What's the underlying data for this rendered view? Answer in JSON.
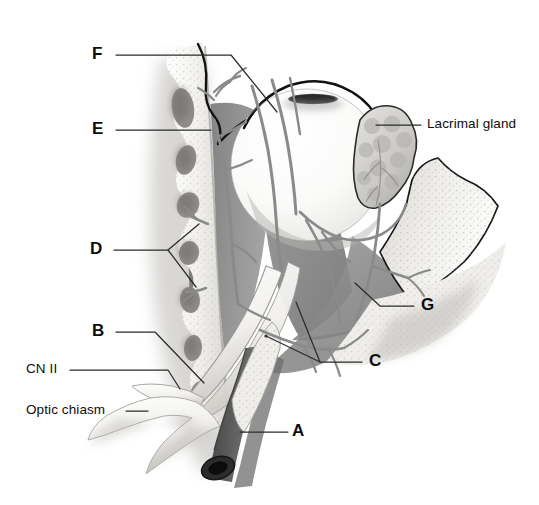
{
  "figure": {
    "style": "grayscale medical illustration",
    "background_color": "#ffffff",
    "line_color": "#1a1a1a"
  },
  "palette": {
    "bone_light": "#f2f1ee",
    "bone_mid": "#dddbd6",
    "bone_shadow": "#a9a7a2",
    "soft_tissue_dark": "#8d8d8d",
    "soft_tissue_mid": "#a6a6a6",
    "globe_white": "#fbfbfa",
    "globe_shadow": "#cfcfcd",
    "vessel_gray": "#8a8a8a",
    "vessel_dark": "#6f6f6f",
    "pupil_dark": "#111111",
    "artery_dark": "#4a4a4a",
    "gland_gray": "#c3c3c1",
    "leader_line": "#2b2b2b"
  },
  "labels": [
    {
      "id": "A",
      "text": "A",
      "kind": "letter",
      "x": 292,
      "y": 424,
      "anchor": "left"
    },
    {
      "id": "B",
      "text": "B",
      "kind": "letter",
      "x": 92,
      "y": 326,
      "anchor": "left"
    },
    {
      "id": "C",
      "text": "C",
      "kind": "letter",
      "x": 369,
      "y": 355,
      "anchor": "left"
    },
    {
      "id": "D",
      "text": "D",
      "kind": "letter",
      "x": 90,
      "y": 243,
      "anchor": "left"
    },
    {
      "id": "E",
      "text": "E",
      "kind": "letter",
      "x": 92,
      "y": 124,
      "anchor": "left"
    },
    {
      "id": "F",
      "text": "F",
      "kind": "letter",
      "x": 92,
      "y": 49,
      "anchor": "left"
    },
    {
      "id": "G",
      "text": "G",
      "kind": "letter",
      "x": 421,
      "y": 299,
      "anchor": "left"
    },
    {
      "id": "CN2",
      "text": "CN II",
      "kind": "word",
      "x": 26,
      "y": 364,
      "anchor": "left"
    },
    {
      "id": "chiasm",
      "text": "Optic chiasm",
      "kind": "word",
      "x": 26,
      "y": 405,
      "anchor": "left"
    },
    {
      "id": "lacrimal",
      "text": "Lacrimal gland",
      "kind": "word",
      "x": 427,
      "y": 118,
      "anchor": "left"
    }
  ],
  "leaders": [
    {
      "for": "F",
      "points": "116,55 231,55 277,112"
    },
    {
      "for": "E",
      "points": "116,130 211,130"
    },
    {
      "for": "D",
      "points": "114,250 168,250 199,224"
    },
    {
      "for": "D2",
      "points": "168,250 196,287"
    },
    {
      "for": "B",
      "points": "116,332 155,332 204,383"
    },
    {
      "for": "CN2",
      "points": "70,370 168,370 180,389"
    },
    {
      "for": "chiasm",
      "points": "126,411 148,411"
    },
    {
      "for": "A",
      "points": "240,432 288,432"
    },
    {
      "for": "C",
      "points": "362,362 320,362 296,302"
    },
    {
      "for": "C2",
      "points": "320,362 266,336"
    },
    {
      "for": "G",
      "points": "414,306 380,306 355,283"
    },
    {
      "for": "lacrimal",
      "points": "421,125 376,125"
    }
  ],
  "structures": [
    {
      "name": "ethmoid-air-cells",
      "description": "scalloped ethmoid bone column with dark air cell cavities, left side"
    },
    {
      "name": "eyeball-globe",
      "description": "large white spherical globe with dark pupil ellipse at top"
    },
    {
      "name": "lacrimal-gland",
      "description": "lobulated gray gland lateral to globe"
    },
    {
      "name": "optic-nerve",
      "description": "pale cylindrical nerve running from globe down-left to chiasm"
    },
    {
      "name": "optic-chiasm",
      "description": "pale X-shaped structure at lower left"
    },
    {
      "name": "orbital-soft-tissue",
      "description": "medium gray cone of orbital contents behind globe"
    },
    {
      "name": "internal-carotid-artery",
      "description": "dark tubular vessel with cut open end at bottom"
    },
    {
      "name": "zygomatic-bone",
      "description": "stippled bone wedge at lower right"
    },
    {
      "name": "nerve-branches",
      "description": "slender gray branching nerves/vessels over globe and orbit"
    }
  ]
}
